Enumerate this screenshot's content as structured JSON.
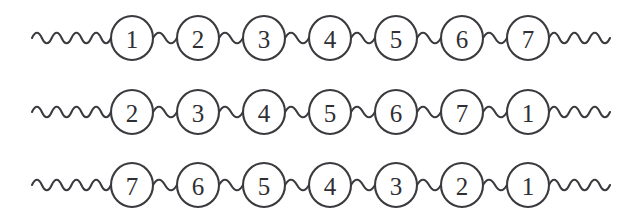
{
  "figure": {
    "name": "braid-strand-diagram",
    "background_color": "#ffffff",
    "stroke_color": "#3a3a3f",
    "label_color": "#2f2f34",
    "node_fill": "#ffffff",
    "width": 636,
    "height": 217,
    "node_radius_x": 21,
    "node_radius_y": 22,
    "node_pitch": 66,
    "first_node_center_x": 132,
    "lead_wave_start_x": 32,
    "trail_wave_end_x": 610,
    "wave_amplitude": 7,
    "wave_cycle_length": 22
  },
  "rows": [
    {
      "name": "row-1",
      "center_y": 38,
      "labels": [
        "1",
        "2",
        "3",
        "4",
        "5",
        "6",
        "7"
      ]
    },
    {
      "name": "row-2",
      "center_y": 112,
      "labels": [
        "2",
        "3",
        "4",
        "5",
        "6",
        "7",
        "1"
      ]
    },
    {
      "name": "row-3",
      "center_y": 185,
      "labels": [
        "7",
        "6",
        "5",
        "4",
        "3",
        "2",
        "1"
      ]
    }
  ]
}
